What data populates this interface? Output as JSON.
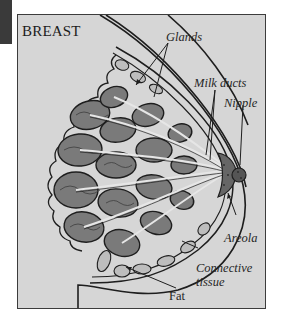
{
  "diagram": {
    "title": "BREAST",
    "labels": {
      "glands": "Glands",
      "milk_ducts": "Milk ducts",
      "nipple": "Nipple",
      "areola": "Areola",
      "connective_tissue_line1": "Connective",
      "connective_tissue_line2": "tissue",
      "fat": "Fat"
    },
    "colors": {
      "background": "#d6d6d6",
      "frame_border": "#3c3c3c",
      "gland_fill": "#7a7a7a",
      "gland_dark": "#4a4a4a",
      "fat_fill": "#bdbdbd",
      "outline": "#1e1e1e"
    }
  }
}
